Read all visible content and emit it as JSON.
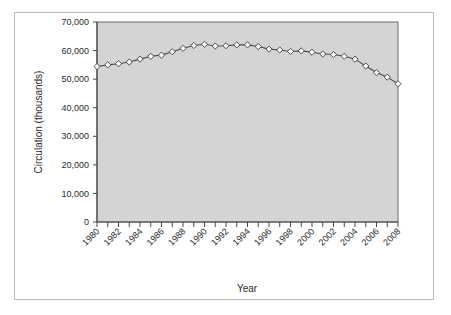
{
  "chart_data": {
    "type": "line",
    "title": "",
    "xlabel": "Year",
    "ylabel": "Circulation (thousands)",
    "xlim": [
      1980,
      2008
    ],
    "ylim": [
      0,
      70000
    ],
    "grid": false,
    "legend": null,
    "marker": "open-diamond",
    "line_color": "#4a4a4a",
    "marker_fill": "#ffffff",
    "marker_edge": "#3a3a3a",
    "plot_background": "#d4d4d4",
    "y_ticks": [
      0,
      10000,
      20000,
      30000,
      40000,
      50000,
      60000,
      70000
    ],
    "y_tick_labels": [
      "0",
      "10,000",
      "20,000",
      "30,000",
      "40,000",
      "50,000",
      "60,000",
      "70,000"
    ],
    "x_ticks": [
      1980,
      1982,
      1984,
      1986,
      1988,
      1990,
      1992,
      1994,
      1996,
      1998,
      2000,
      2002,
      2004,
      2006,
      2008
    ],
    "x_tick_labels": [
      "1980",
      "1982",
      "1984",
      "1986",
      "1988",
      "1990",
      "1992",
      "1994",
      "1996",
      "1998",
      "2000",
      "2002",
      "2004",
      "2006",
      "2008"
    ],
    "x": [
      1980,
      1981,
      1982,
      1983,
      1984,
      1985,
      1986,
      1987,
      1988,
      1989,
      1990,
      1991,
      1992,
      1993,
      1994,
      1995,
      1996,
      1997,
      1998,
      1999,
      2000,
      2001,
      2002,
      2003,
      2004,
      2005,
      2006,
      2007,
      2008
    ],
    "values": [
      54400,
      55000,
      55400,
      56000,
      57000,
      58000,
      58400,
      59600,
      60800,
      61800,
      62200,
      61600,
      61700,
      62000,
      62000,
      61400,
      60500,
      60200,
      59700,
      59900,
      59400,
      58800,
      58600,
      58000,
      57000,
      54600,
      52300,
      50700,
      48400
    ],
    "series": [
      {
        "name": "Circulation",
        "values": [
          54400,
          55000,
          55400,
          56000,
          57000,
          58000,
          58400,
          59600,
          60800,
          61800,
          62200,
          61600,
          61700,
          62000,
          62000,
          61400,
          60500,
          60200,
          59700,
          59900,
          59400,
          58800,
          58600,
          58000,
          57000,
          54600,
          52300,
          50700,
          48400
        ]
      }
    ]
  }
}
